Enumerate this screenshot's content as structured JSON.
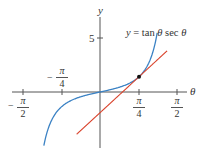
{
  "chart_data": {
    "type": "line",
    "title": "",
    "xlabel": "θ",
    "ylabel": "y",
    "xlim": [
      -2.03,
      2.1
    ],
    "ylim": [
      -5.6,
      8.5
    ],
    "grid": false,
    "x_ticks": [
      {
        "value": -1.5708,
        "label_num": "π",
        "label_den": "2",
        "sign": "−"
      },
      {
        "value": -0.7854,
        "label_num": "π",
        "label_den": "4",
        "sign": "−"
      },
      {
        "value": 0.7854,
        "label_num": "π",
        "label_den": "4",
        "sign": ""
      },
      {
        "value": 1.5708,
        "label_num": "π",
        "label_den": "2",
        "sign": ""
      }
    ],
    "y_ticks": [
      {
        "value": 5,
        "label": "5"
      }
    ],
    "series": [
      {
        "name": "y = tan θ sec θ",
        "color": "#3b82c4",
        "function": "tan(θ)·sec(θ)",
        "x_range": [
          -1.13,
          1.15
        ]
      },
      {
        "name": "tangent line at θ = π/4",
        "color": "#d9422b",
        "function": "√2 + 3√2(θ − π/4)",
        "x_range": [
          -0.47,
          1.35
        ]
      }
    ],
    "points": [
      {
        "x": 0.7854,
        "y": 1.4142,
        "label": "point of tangency",
        "color": "#111111"
      }
    ],
    "annotations": [
      {
        "text": "y = tan θ sec θ",
        "anchor": "upper-right"
      }
    ]
  },
  "labels": {
    "y_axis": "y",
    "x_axis": "θ",
    "y_tick_5": "5",
    "curve_eq_y": "y",
    "curve_eq_eq": " = tan ",
    "curve_eq_theta1": "θ",
    "curve_eq_sec": " sec ",
    "curve_eq_theta2": "θ",
    "pi": "π",
    "four": "4",
    "two": "2",
    "minus": "−"
  }
}
